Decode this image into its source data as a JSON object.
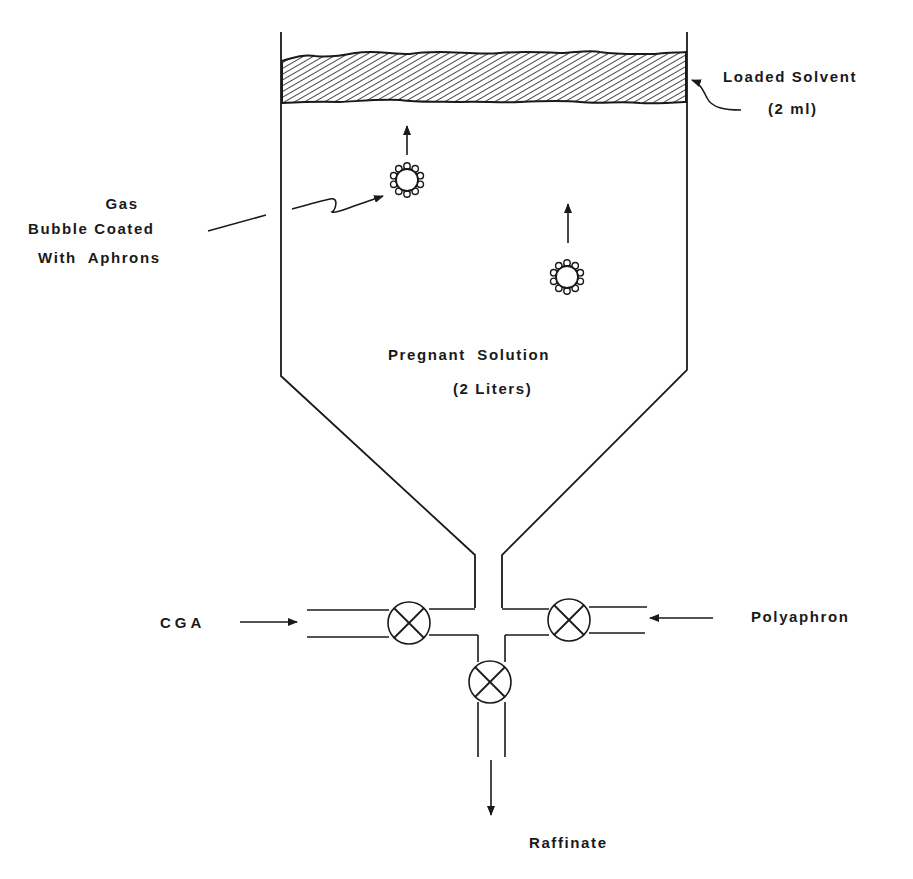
{
  "diagram": {
    "type": "flotation-column-schematic",
    "colors": {
      "ink": "#1a1a1a",
      "background": "#ffffff"
    },
    "labels": {
      "loaded_solvent": "Loaded Solvent",
      "loaded_solvent_volume": "(2 ml)",
      "gas_bubble_line1": "Gas",
      "gas_bubble_line2": "Bubble Coated",
      "gas_bubble_line3": "With  Aphrons",
      "pregnant_solution": "Pregnant  Solution",
      "pregnant_solution_volume": "(2 Liters)",
      "cga_inlet": "CGA",
      "polyaphron_inlet": "Polyaphron",
      "raffinate_outlet": "Raffinate"
    },
    "components": [
      {
        "id": "vessel",
        "name": "Column vessel with conical bottom"
      },
      {
        "id": "solvent-layer",
        "name": "Loaded solvent layer (hatched)"
      },
      {
        "id": "bubble-1",
        "name": "Gas bubble coated with aphrons",
        "direction": "up"
      },
      {
        "id": "bubble-2",
        "name": "Gas bubble coated with aphrons",
        "direction": "up"
      },
      {
        "id": "valve-cga",
        "name": "CGA inlet valve"
      },
      {
        "id": "valve-polyaphron",
        "name": "Polyaphron inlet valve"
      },
      {
        "id": "valve-raffinate",
        "name": "Raffinate outlet valve"
      }
    ]
  }
}
